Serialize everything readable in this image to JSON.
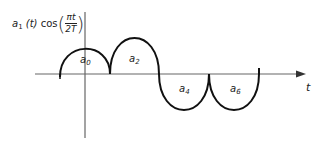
{
  "diagram": {
    "y_axis_label": {
      "coefficient": "a",
      "coefficient_subscript": "1",
      "argument": "(t)",
      "function": "cos",
      "fraction_numerator": "πt",
      "fraction_denominator": "2T"
    },
    "x_axis_label": "t",
    "region_labels": [
      {
        "base": "a",
        "sub": "0"
      },
      {
        "base": "a",
        "sub": "2"
      },
      {
        "base": "a",
        "sub": "4"
      },
      {
        "base": "a",
        "sub": "6"
      }
    ],
    "colors": {
      "curve": "#111111",
      "axis": "#555555",
      "text": "#222222"
    }
  }
}
